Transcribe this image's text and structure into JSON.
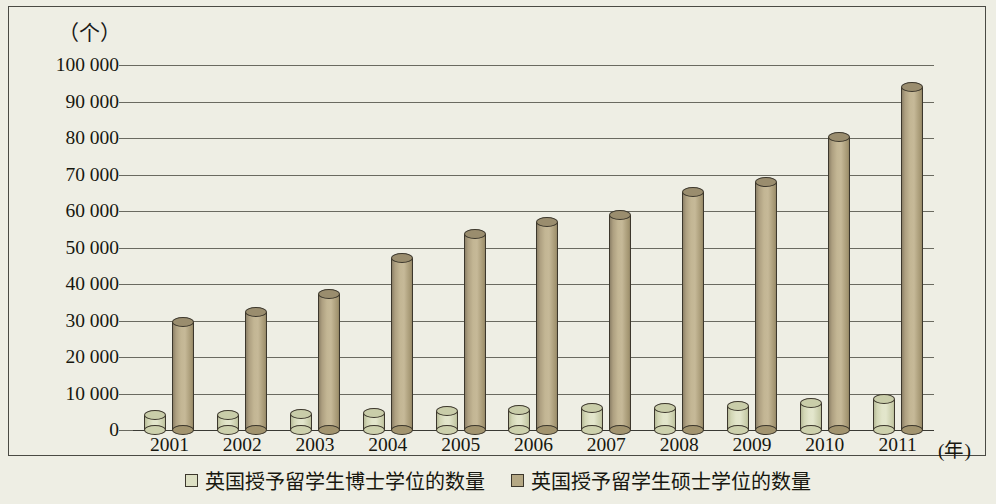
{
  "chart_data": {
    "type": "bar",
    "title": "",
    "xlabel": "年",
    "ylabel": "个",
    "y_unit_caption": "（个）",
    "x_unit_caption": "(年)",
    "categories": [
      "2001",
      "2002",
      "2003",
      "2004",
      "2005",
      "2006",
      "2007",
      "2008",
      "2009",
      "2010",
      "2011"
    ],
    "series": [
      {
        "name": "英国授予留学生博士学位的数量",
        "color": "#dde0c4",
        "values": [
          4000,
          4200,
          4300,
          4600,
          5100,
          5600,
          6000,
          6100,
          6700,
          7500,
          8500
        ]
      },
      {
        "name": "英国授予留学生硕士学位的数量",
        "color": "#b5a884",
        "values": [
          29700,
          32200,
          37200,
          47000,
          53800,
          57000,
          59000,
          65300,
          68000,
          80200,
          94000
        ]
      }
    ],
    "ylim": [
      0,
      100000
    ],
    "y_ticks": [
      0,
      10000,
      20000,
      30000,
      40000,
      50000,
      60000,
      70000,
      80000,
      90000,
      100000
    ],
    "y_tick_labels": [
      "0",
      "10 000",
      "20 000",
      "30 000",
      "40 000",
      "50 000",
      "60 000",
      "70 000",
      "80 000",
      "90 000",
      "100 000"
    ],
    "grid": true,
    "legend_position": "bottom"
  },
  "legend": {
    "items": [
      {
        "label": "英国授予留学生博士学位的数量",
        "swatch": "doctoral"
      },
      {
        "label": "英国授予留学生硕士学位的数量",
        "swatch": "master"
      }
    ]
  }
}
